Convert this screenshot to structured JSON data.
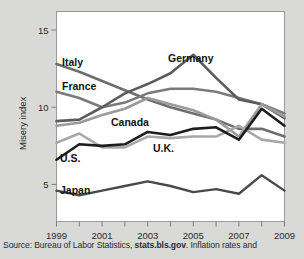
{
  "caption": {
    "prefix": "Source: Bureau of Labor Statistics, ",
    "link": "stats.bls.gov",
    "suffix": ". Inflation rates and"
  },
  "chart_data": {
    "type": "line",
    "title": "",
    "xlabel": "",
    "ylabel": "Misery index",
    "x": [
      1999,
      2000,
      2001,
      2002,
      2003,
      2004,
      2005,
      2006,
      2007,
      2008,
      2009
    ],
    "xtick_labels": [
      "1999",
      "",
      "2001",
      "",
      "2003",
      "",
      "2005",
      "",
      "2007",
      "",
      "2009"
    ],
    "xlim": [
      1999,
      2009
    ],
    "ylim": [
      2.6,
      16.2
    ],
    "yticks": [
      5,
      10,
      15
    ],
    "ytick_labels": [
      "5",
      "10",
      "15"
    ],
    "grid": false,
    "legend_position": "inline-annotations",
    "series": [
      {
        "name": "Italy",
        "color": "#6e6e6e",
        "width": 2.6,
        "values": [
          12.8,
          12.3,
          11.7,
          11.1,
          10.5,
          10.0,
          9.6,
          9.2,
          8.6,
          8.6,
          8.1
        ]
      },
      {
        "name": "France",
        "color": "#7a7a7a",
        "width": 2.6,
        "values": [
          11.0,
          10.6,
          10.0,
          10.3,
          10.9,
          11.2,
          11.2,
          11.0,
          10.6,
          10.2,
          9.6
        ]
      },
      {
        "name": "Germany",
        "color": "#5c5c5c",
        "width": 2.6,
        "values": [
          9.1,
          9.2,
          10.0,
          10.9,
          11.5,
          12.2,
          13.4,
          11.9,
          10.5,
          10.2,
          9.3
        ]
      },
      {
        "name": "Canada",
        "color": "#9b9b9b",
        "width": 2.6,
        "values": [
          8.8,
          9.0,
          9.5,
          9.9,
          10.6,
          10.2,
          9.8,
          9.2,
          8.1,
          10.2,
          9.4
        ]
      },
      {
        "name": "U.K.",
        "color": "#a8a8a8",
        "width": 2.6,
        "values": [
          7.7,
          8.3,
          7.4,
          7.4,
          8.1,
          8.0,
          8.1,
          8.1,
          8.8,
          7.9,
          7.7
        ]
      },
      {
        "name": "U.S.",
        "color": "#1d1d1d",
        "width": 2.6,
        "values": [
          6.6,
          7.6,
          7.5,
          7.6,
          8.4,
          8.2,
          8.6,
          8.7,
          7.9,
          9.9,
          8.8
        ]
      },
      {
        "name": "Japan",
        "color": "#4a4a4a",
        "width": 2.4,
        "values": [
          4.6,
          4.3,
          4.6,
          4.9,
          5.2,
          4.9,
          4.5,
          4.7,
          4.4,
          5.6,
          4.6
        ]
      }
    ],
    "annotations": [
      {
        "text": "Italy",
        "x": 62,
        "y": 66
      },
      {
        "text": "France",
        "x": 62,
        "y": 90
      },
      {
        "text": "Germany",
        "x": 168,
        "y": 62
      },
      {
        "text": "Canada",
        "x": 111,
        "y": 126
      },
      {
        "text": "U.K.",
        "x": 153,
        "y": 152
      },
      {
        "text": "U.S.",
        "x": 60,
        "y": 162
      },
      {
        "text": "Japan",
        "x": 60,
        "y": 194
      }
    ]
  }
}
